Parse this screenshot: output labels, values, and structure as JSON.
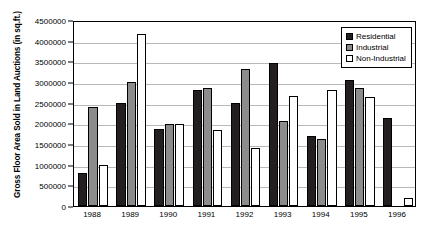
{
  "chart_data": {
    "type": "bar",
    "title": "",
    "xlabel": "",
    "ylabel": "Gross Floor Area Sold in Land Auctions (in sq.ft.)",
    "categories": [
      "1988",
      "1989",
      "1990",
      "1991",
      "1992",
      "1993",
      "1994",
      "1995",
      "1996"
    ],
    "series": [
      {
        "name": "Residential",
        "values": [
          800000,
          2490000,
          1870000,
          2810000,
          2500000,
          3450000,
          1700000,
          3050000,
          2120000
        ]
      },
      {
        "name": "Industrial",
        "values": [
          2390000,
          2990000,
          1990000,
          2860000,
          3310000,
          2060000,
          1620000,
          2850000,
          0
        ]
      },
      {
        "name": "Non-Industrial",
        "values": [
          1000000,
          4170000,
          1990000,
          1850000,
          1400000,
          2650000,
          2800000,
          2640000,
          200000
        ]
      }
    ],
    "ylim": [
      0,
      4500000
    ],
    "yticks": [
      0,
      500000,
      1000000,
      1500000,
      2000000,
      2500000,
      3000000,
      3500000,
      4000000,
      4500000
    ],
    "ytick_labels": [
      "0",
      "500000",
      "1000000",
      "1500000",
      "2000000",
      "2500000",
      "3000000",
      "3500000",
      "4000000",
      "4500000"
    ],
    "grid": true,
    "legend_position": "top-right",
    "legend_entries": [
      "Residential",
      "Industrial",
      "Non-Industrial"
    ],
    "colors": {
      "Residential": "#231f20",
      "Industrial": "#8c8c8c",
      "Non-Industrial": "#ffffff",
      "axis": "#000000",
      "gridline": "#b8b8b8"
    }
  }
}
